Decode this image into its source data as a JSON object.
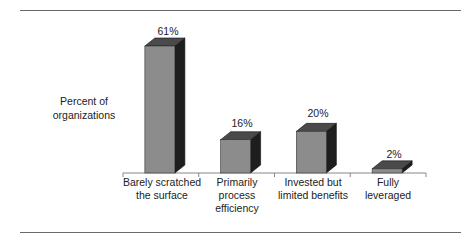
{
  "chart_data": {
    "type": "bar",
    "style": "3d-column",
    "title": "",
    "xlabel": "",
    "ylabel": "Percent of organizations",
    "categories": [
      "Barely scratched the surface",
      "Primarily process efficiency",
      "Invested but limited benefits",
      "Fully leveraged"
    ],
    "values": [
      61,
      16,
      20,
      2
    ],
    "value_labels": [
      "61%",
      "16%",
      "20%",
      "2%"
    ],
    "ylim": [
      0,
      70
    ],
    "grid": false,
    "legend": "none"
  },
  "labels": {
    "ylabel_line1": "Percent of",
    "ylabel_line2": "organizations",
    "cat0_line1": "Barely scratched",
    "cat0_line2": "the surface",
    "cat1_line1": "Primarily",
    "cat1_line2": "process",
    "cat1_line3": "efficiency",
    "cat2_line1": "Invested but",
    "cat2_line2": "limited benefits",
    "cat3_line1": "Fully",
    "cat3_line2": "leveraged",
    "val0": "61%",
    "val1": "16%",
    "val2": "20%",
    "val3": "2%"
  },
  "colors": {
    "front": "#8c8c8c",
    "top": "#4a4a4a",
    "side": "#1e1e1e",
    "axis": "#888888"
  }
}
